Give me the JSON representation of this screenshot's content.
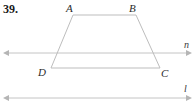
{
  "problem": {
    "number": "39."
  },
  "figure": {
    "type": "geometry-diagram",
    "stroke_color": "#c0c0c0",
    "label_color": "#2b2b2b",
    "background_color": "#ffffff",
    "vertices": [
      {
        "name": "A",
        "label": "A",
        "x": 73,
        "y": 15
      },
      {
        "name": "B",
        "label": "B",
        "x": 136,
        "y": 15
      },
      {
        "name": "C",
        "label": "C",
        "x": 160,
        "y": 68
      },
      {
        "name": "D",
        "label": "D",
        "x": 51,
        "y": 68
      }
    ],
    "edges": [
      {
        "name": "AB",
        "from": "A",
        "to": "B"
      },
      {
        "name": "BC",
        "from": "B",
        "to": "C"
      },
      {
        "name": "CD",
        "from": "C",
        "to": "D"
      },
      {
        "name": "DA",
        "from": "D",
        "to": "A"
      }
    ],
    "lines": [
      {
        "name": "n",
        "label": "n",
        "y": 53,
        "x_start": 5,
        "x_end": 190,
        "arrows": "both"
      },
      {
        "name": "l",
        "label": "l",
        "y": 98,
        "x_start": 5,
        "x_end": 190,
        "arrows": "both"
      }
    ]
  }
}
